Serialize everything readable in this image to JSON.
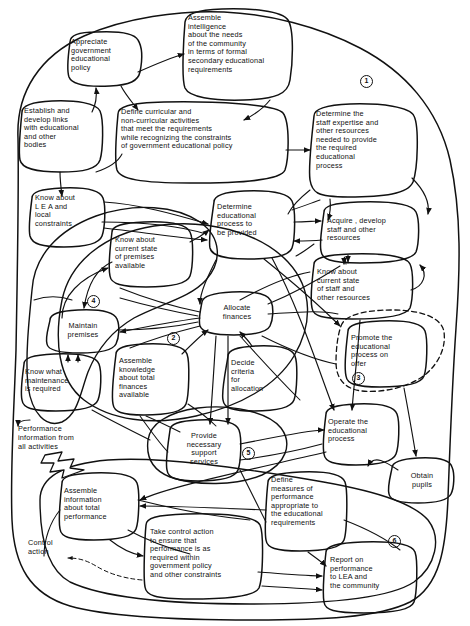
{
  "diagram": {
    "type": "soft-systems conceptual model",
    "stroke_color": "#111111",
    "background_color": "#ffffff",
    "width": 470,
    "height": 626
  },
  "nodes": [
    {
      "id": "n1",
      "label": "Appreciate\ngovernment\neducational\npolicy"
    },
    {
      "id": "n2",
      "label": "Assemble\nintelligence\nabout the needs\nof the community\nin terms of formal\nsecondary educational\nrequirements"
    },
    {
      "id": "n3",
      "label": "Establish and\ndevelop links\nwith educational\nand other\nbodies"
    },
    {
      "id": "n4",
      "label": "Define curricular and\nnon-curricular activities\nthat meet the requirements\nwhile recognizing the constraints\nof government educational policy"
    },
    {
      "id": "n5",
      "label": "Determine the\nstaff expertise and\nother resources\nneeded to provide\nthe required\neducational\nprocess"
    },
    {
      "id": "n6",
      "label": "Know about\nL E A and\nlocal\nconstraints"
    },
    {
      "id": "n7",
      "label": "Determine\neducational\nprocess to\nbe provided"
    },
    {
      "id": "n8",
      "label": "Acquire , develop\nstaff and other\nresources"
    },
    {
      "id": "n9",
      "label": "Know about\ncurrent state\nof premises\navailable"
    },
    {
      "id": "n10",
      "label": "Know about\ncurrent state\nof staff and\nother resources"
    },
    {
      "id": "n11",
      "label": "Allocate\nfinances"
    },
    {
      "id": "n12",
      "label": "Maintain\npremises"
    },
    {
      "id": "n13",
      "label": "Assemble\nknowledge\nabout total\nfinances\navailable"
    },
    {
      "id": "n14",
      "label": "Decide\ncriteria\nfor\nallocation"
    },
    {
      "id": "n15",
      "label": "Promote the\neducational\nprocess on\n        offer"
    },
    {
      "id": "n16",
      "label": "Know what\nmaintenance\nis required"
    },
    {
      "id": "n17",
      "label": "Provide\nnecessary\nsupport\nservices"
    },
    {
      "id": "n18",
      "label": "Operate the\neducational\nprocess"
    },
    {
      "id": "n19",
      "label": "Obtain\npupils"
    },
    {
      "id": "n20",
      "label": "Assemble\ninformation\nabout total\nperformance"
    },
    {
      "id": "n21",
      "label": "Define\nmeasures of\nperformance\nappropriate to\nthe educational\nrequirements"
    },
    {
      "id": "n22",
      "label": "Take control action\nto ensure that\nperformance is as\nrequired within\ngovernment policy\nand other constraints"
    },
    {
      "id": "n23",
      "label": "Report on\nperformance\nto LEA and\nthe community"
    }
  ],
  "free_labels": [
    {
      "id": "f1",
      "text": "Performance\ninformation from\nall activities"
    },
    {
      "id": "f2",
      "text": "Control\naction"
    }
  ],
  "boundary_markers": [
    {
      "id": "m1",
      "text": "1"
    },
    {
      "id": "m2",
      "text": "4"
    },
    {
      "id": "m3",
      "text": "2"
    },
    {
      "id": "m4",
      "text": "3"
    },
    {
      "id": "m5",
      "text": "5"
    },
    {
      "id": "m6",
      "text": "6"
    }
  ]
}
